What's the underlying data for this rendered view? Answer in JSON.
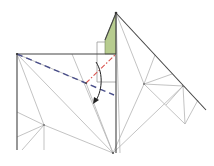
{
  "diagram": {
    "type": "origami-crease-pattern-step",
    "colors": {
      "background": "#ffffff",
      "paper_edge": "#444444",
      "crease": "#b4b4b4",
      "valley_fold": "#4a4f8a",
      "mountain_fold": "#d9534f",
      "colored_side": "#b7cc8f",
      "arrow": "#222222"
    },
    "nodes": {
      "apex": [
        116,
        13
      ],
      "square_top_left": [
        17,
        54
      ],
      "square_top_right": [
        116,
        54
      ],
      "square_inner_bottom": [
        116,
        82
      ],
      "bottom_vertex": [
        113,
        153
      ],
      "right_tip": [
        206,
        110
      ],
      "inner_right_a": [
        144,
        84
      ],
      "inner_right_b": [
        183,
        86
      ],
      "inner_right_c": [
        185,
        124
      ],
      "inner_left": [
        44,
        125
      ],
      "fold_pivot": [
        86,
        83
      ]
    },
    "folds": {
      "valley": {
        "from": [
          17,
          54
        ],
        "to": [
          114,
          95
        ]
      },
      "mountain": {
        "from": [
          86,
          83
        ],
        "to": [
          116,
          54
        ]
      }
    },
    "arrow": {
      "from": [
        96,
        62
      ],
      "to": [
        95,
        103
      ],
      "direction": "fold-down"
    }
  }
}
